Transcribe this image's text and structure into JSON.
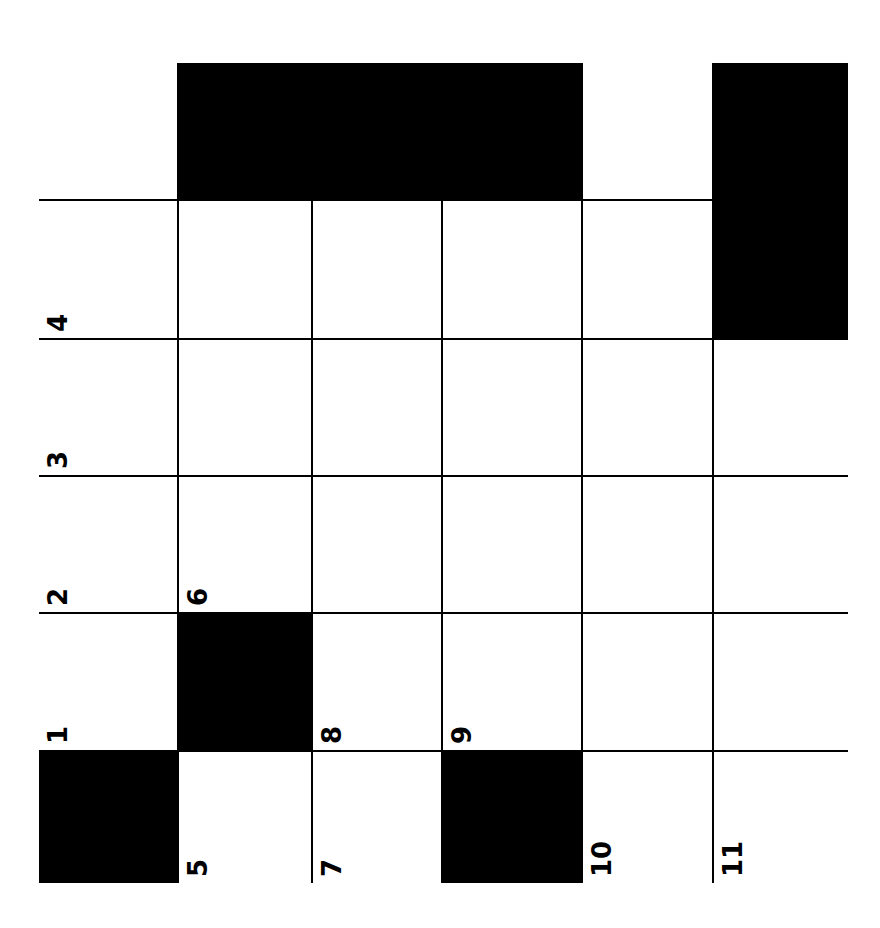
{
  "puzzle": {
    "type": "crossword",
    "orientation": "rotated-90-ccw",
    "rows": 6,
    "cols": 6,
    "colors": {
      "block": "#000000",
      "open": "#ffffff",
      "line": "#000000"
    },
    "col_edges": [
      0,
      140,
      274,
      404,
      544,
      675,
      809
    ],
    "row_edges": [
      0,
      138,
      277,
      414,
      551,
      689,
      820
    ],
    "cells": [
      [
        {
          "black": false,
          "num": ""
        },
        {
          "black": true,
          "num": ""
        },
        {
          "black": true,
          "num": ""
        },
        {
          "black": true,
          "num": ""
        },
        {
          "black": false,
          "num": ""
        },
        {
          "black": true,
          "num": ""
        }
      ],
      [
        {
          "black": false,
          "num": "4"
        },
        {
          "black": false,
          "num": ""
        },
        {
          "black": false,
          "num": ""
        },
        {
          "black": false,
          "num": ""
        },
        {
          "black": false,
          "num": ""
        },
        {
          "black": true,
          "num": ""
        }
      ],
      [
        {
          "black": false,
          "num": "3"
        },
        {
          "black": false,
          "num": ""
        },
        {
          "black": false,
          "num": ""
        },
        {
          "black": false,
          "num": ""
        },
        {
          "black": false,
          "num": ""
        },
        {
          "black": false,
          "num": ""
        }
      ],
      [
        {
          "black": false,
          "num": "2"
        },
        {
          "black": false,
          "num": "6"
        },
        {
          "black": false,
          "num": ""
        },
        {
          "black": false,
          "num": ""
        },
        {
          "black": false,
          "num": ""
        },
        {
          "black": false,
          "num": ""
        }
      ],
      [
        {
          "black": false,
          "num": "1"
        },
        {
          "black": true,
          "num": ""
        },
        {
          "black": false,
          "num": "8"
        },
        {
          "black": false,
          "num": "9"
        },
        {
          "black": false,
          "num": ""
        },
        {
          "black": false,
          "num": ""
        }
      ],
      [
        {
          "black": true,
          "num": ""
        },
        {
          "black": false,
          "num": "5"
        },
        {
          "black": false,
          "num": "7"
        },
        {
          "black": true,
          "num": ""
        },
        {
          "black": false,
          "num": "10"
        },
        {
          "black": false,
          "num": "11"
        }
      ]
    ]
  }
}
